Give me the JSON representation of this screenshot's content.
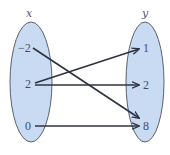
{
  "diagram": {
    "type": "mapping-diagram",
    "domain_set": {
      "label": "x",
      "elements": [
        "−2",
        "2",
        "0"
      ]
    },
    "codomain_set": {
      "label": "y",
      "elements": [
        "1",
        "2",
        "8"
      ]
    },
    "mappings": [
      {
        "from": "−2",
        "to": "8"
      },
      {
        "from": "2",
        "to": "1"
      },
      {
        "from": "2",
        "to": "2"
      },
      {
        "from": "0",
        "to": "8"
      }
    ],
    "colors": {
      "ellipse_fill": "#c9daf3",
      "ellipse_stroke": "#5c6170",
      "arrow": "#2f3340",
      "text": "#4a4f5c"
    }
  }
}
